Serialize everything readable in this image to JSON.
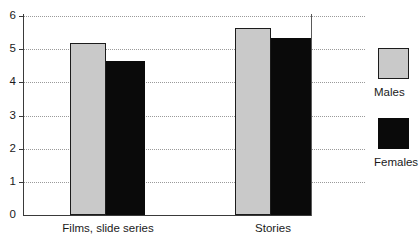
{
  "chart_data": {
    "type": "bar",
    "title": "",
    "subtitle": "",
    "xlabel": "",
    "ylabel": "",
    "categories": [
      "Films, slide series",
      "Stories"
    ],
    "series": [
      {
        "name": "Males",
        "values": [
          5.2,
          5.65
        ]
      },
      {
        "name": "Females",
        "values": [
          4.65,
          5.35
        ]
      }
    ],
    "ylim": [
      0,
      6
    ],
    "yticks": [
      0,
      1,
      2,
      3,
      4,
      5,
      6
    ],
    "ytick_labels": [
      "0",
      "1",
      "2",
      "3",
      "4",
      "5",
      "6"
    ],
    "grid": true,
    "grid_axis": "y",
    "grid_style": "dotted",
    "legend_position": "right",
    "colors": {
      "males": "#c9c9c9",
      "females": "#0a0a0a",
      "bar_outline": "#1c1c1c",
      "axis": "#3a3a3a",
      "gridline": "#9a9a9a",
      "text": "#1a1a1a",
      "background": "#ffffff"
    }
  },
  "legend": {
    "entries": [
      {
        "label": "Males",
        "swatch": "males-swatch"
      },
      {
        "label": "Females",
        "swatch": "females-swatch"
      }
    ]
  },
  "axis": {
    "y_tick_labels": [
      "6",
      "5",
      "4",
      "3",
      "2",
      "1",
      "0"
    ]
  }
}
